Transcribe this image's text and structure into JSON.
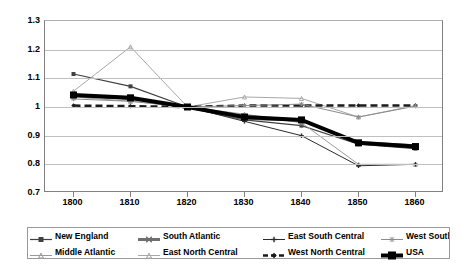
{
  "chart_data": {
    "type": "line",
    "title": "",
    "xlabel": "",
    "ylabel": "",
    "x": [
      1800,
      1810,
      1820,
      1830,
      1840,
      1850,
      1860
    ],
    "xlim": [
      1795,
      1865
    ],
    "ylim": [
      0.7,
      1.3
    ],
    "ytick_labels": [
      "1.3",
      "1.2",
      "1.1",
      "1",
      "0.9",
      "0.8",
      "0.7"
    ],
    "yticks": [
      1.3,
      1.2,
      1.1,
      1.0,
      0.9,
      0.8,
      0.7
    ],
    "xtick_labels": [
      "1800",
      "1810",
      "1820",
      "1830",
      "1840",
      "1850",
      "1860"
    ],
    "grid": "horizontal",
    "legend_position": "bottom",
    "legend_columns": 4,
    "series": [
      {
        "name": "New England",
        "color": "#404040",
        "marker": "square",
        "marker_size": 4,
        "line_width": 1.2,
        "dash": "solid",
        "values": [
          1.115,
          1.072,
          1.0,
          0.955,
          0.935,
          0.87,
          0.855
        ]
      },
      {
        "name": "Middle Atlantic",
        "color": "#9a9a9a",
        "marker": "triangle",
        "marker_size": 4,
        "line_width": 1,
        "dash": "solid",
        "values": [
          1.035,
          1.02,
          1.0,
          0.975,
          0.945,
          0.8,
          0.8
        ]
      },
      {
        "name": "South Atlantic",
        "color": "#6f6f6f",
        "marker": "cross",
        "marker_size": 4.5,
        "line_width": 3,
        "dash": "solid",
        "values": [
          1.04,
          1.03,
          1.0,
          0.96,
          0.955,
          0.875,
          0.865
        ]
      },
      {
        "name": "East North Central",
        "color": "#a8a8a8",
        "marker": "triangle",
        "marker_size": 4,
        "line_width": 1,
        "dash": "solid",
        "values": [
          1.055,
          1.21,
          1.0,
          1.035,
          1.03,
          0.965,
          1.005
        ]
      },
      {
        "name": "East South Central",
        "color": "#2b2b2b",
        "marker": "plus",
        "marker_size": 4.5,
        "line_width": 1,
        "dash": "solid",
        "values": [
          1.038,
          1.028,
          1.0,
          0.95,
          0.9,
          0.795,
          0.8
        ]
      },
      {
        "name": "West North Central",
        "color": "#1a1a1a",
        "marker": "diamond",
        "marker_size": 4.5,
        "line_width": 2.5,
        "dash": "dashed",
        "values": [
          1.005,
          1.003,
          1.0,
          1.005,
          1.005,
          1.005,
          1.005
        ]
      },
      {
        "name": "West South Central",
        "color": "#8c8c8c",
        "marker": "star",
        "marker_size": 4.5,
        "line_width": 1,
        "dash": "solid",
        "values": [
          1.028,
          1.02,
          1.0,
          1.005,
          1.01,
          0.965,
          1.003
        ]
      },
      {
        "name": "USA",
        "color": "#000000",
        "marker": "bigsquare",
        "marker_size": 7,
        "line_width": 4,
        "dash": "solid",
        "values": [
          1.042,
          1.032,
          1.0,
          0.965,
          0.955,
          0.875,
          0.862
        ]
      }
    ]
  }
}
